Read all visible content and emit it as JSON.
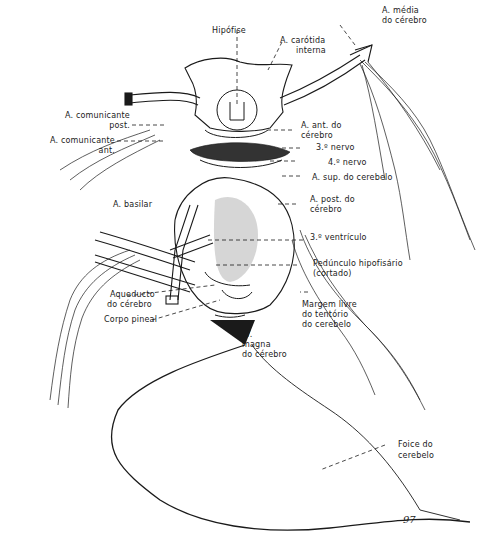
{
  "figure": {
    "type": "anatomical line drawing",
    "ink_color": "#1a1a1a",
    "background": "#ffffff",
    "page_number": "97"
  },
  "labels": {
    "hipofise": "Hipófise",
    "carotida_interna_1": "A. carótida",
    "carotida_interna_2": "interna",
    "media_cerebro_1": "A. média",
    "media_cerebro_2": "do cérebro",
    "comunicante_post_1": "A. comunicante",
    "comunicante_post_2": "post.",
    "comunicante_ant_1": "A. comunicante",
    "comunicante_ant_2": "ant.",
    "ant_cerebro_1": "A. ant. do",
    "ant_cerebro_2": "cérebro",
    "nervo_3": "3.º nervo",
    "nervo_4": "4.º nervo",
    "sup_cerebelo": "A. sup. do cerebelo",
    "basilar": "A. basilar",
    "post_cerebro_1": "A. post. do",
    "post_cerebro_2": "cérebro",
    "ventriculo_3": "3.º ventrículo",
    "pedunculo_1": "Pedúnculo hipofisário",
    "pedunculo_2": "(cortado)",
    "aqueducto_1": "Aqueducto",
    "aqueducto_2": "do cérebro",
    "corpo_pineal": "Corpo pineal",
    "margem_1": "Margem livre",
    "margem_2": "do tentório",
    "margem_3": "do cerebelo",
    "v_magna_1": "V.",
    "v_magna_2": "magna",
    "v_magna_3": "do cérebro",
    "foice_1": "Foice do",
    "foice_2": "cerebelo"
  }
}
